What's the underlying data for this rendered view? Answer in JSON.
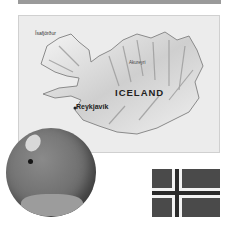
{
  "map": {
    "title": "ICELAND",
    "places": [
      {
        "name": "Ísafjörður"
      },
      {
        "name": "Akureyri"
      },
      {
        "name": "Reykjavík",
        "capital": true
      }
    ]
  },
  "globe": {
    "marker": "iceland-location-dot"
  },
  "flag": {
    "country": "Iceland",
    "colors": {
      "field": "#4a4a4a",
      "border": "#f2f2f2",
      "cross": "#2a2a2a"
    }
  }
}
